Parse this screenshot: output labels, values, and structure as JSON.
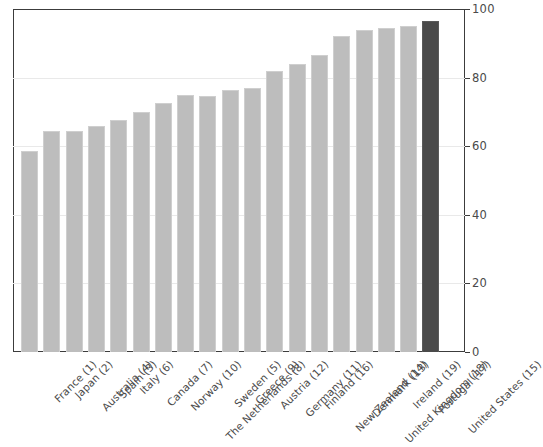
{
  "chart_data": {
    "type": "bar",
    "title": "",
    "xlabel": "",
    "ylabel": "",
    "ylim": [
      0,
      100
    ],
    "yticks": [
      0,
      20,
      40,
      60,
      80,
      100
    ],
    "grid": true,
    "legend": null,
    "categories": [
      "France (1)",
      "Japan (2)",
      "Australia (4)",
      "Spain (3)",
      "Italy (6)",
      "Canada (7)",
      "Norway (10)",
      "The Netherlands (8)",
      "Sweden (5)",
      "Greece (9)",
      "Austria (12)",
      "Germany (11)",
      "Finland (16)",
      "New Zealand (14)",
      "Denmark (13)",
      "United Kingdom (18)",
      "Ireland (19)",
      "Portugal (17)",
      "United States (15)"
    ],
    "values": [
      58.5,
      64.5,
      64.5,
      66,
      67.5,
      70,
      72.5,
      75,
      74.5,
      76.5,
      77,
      82,
      84,
      86.5,
      92,
      94,
      94.5,
      95,
      96.5
    ],
    "bar_colors": [
      "#bdbdbd",
      "#bdbdbd",
      "#bdbdbd",
      "#bdbdbd",
      "#bdbdbd",
      "#bdbdbd",
      "#bdbdbd",
      "#bdbdbd",
      "#bdbdbd",
      "#bdbdbd",
      "#bdbdbd",
      "#bdbdbd",
      "#bdbdbd",
      "#bdbdbd",
      "#bdbdbd",
      "#bdbdbd",
      "#bdbdbd",
      "#bdbdbd",
      "#4a4a4a"
    ],
    "highlight_index": 18,
    "colors": {
      "bar": "#bdbdbd",
      "highlight_bar": "#4a4a4a",
      "axis": "#3c3c3c",
      "grid": "#e9e9e9",
      "tick_text": "#4a4a4a"
    }
  }
}
